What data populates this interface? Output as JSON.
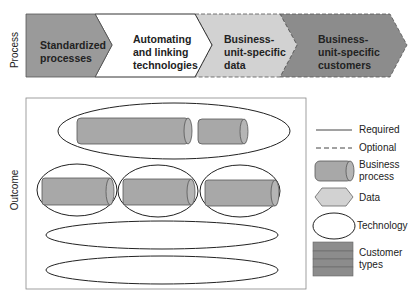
{
  "process": {
    "axis_label": "Process",
    "steps": [
      {
        "lines": [
          "Standardized",
          "processes"
        ],
        "fill": "#9a9a9a",
        "border": "solid"
      },
      {
        "lines": [
          "Automating",
          "and linking",
          "technologies"
        ],
        "fill": "#ffffff",
        "border": "solid"
      },
      {
        "lines": [
          "Business-",
          "unit-specific",
          "data"
        ],
        "fill": "#d2d2d2",
        "border": "dashed"
      },
      {
        "lines": [
          "Business-",
          "unit-specific",
          "customers"
        ],
        "fill": "#8c8c8c",
        "border": "dashed"
      }
    ]
  },
  "outcome": {
    "axis_label": "Outcome"
  },
  "legend": {
    "items": [
      {
        "label": [
          "Required"
        ],
        "symbol": "solid-line"
      },
      {
        "label": [
          "Optional"
        ],
        "symbol": "dashed-line"
      },
      {
        "label": [
          "Business",
          "process"
        ],
        "symbol": "cylinder"
      },
      {
        "label": [
          "Data"
        ],
        "symbol": "hexagon"
      },
      {
        "label": [
          "Technology"
        ],
        "symbol": "ellipse"
      },
      {
        "label": [
          "Customer",
          "types"
        ],
        "symbol": "stacked-bars"
      }
    ]
  },
  "colors": {
    "cylinder": "#a8a8a8",
    "data_hex": "#d2d2d2",
    "customer": "#8c8c8c",
    "stroke": "#333333"
  }
}
